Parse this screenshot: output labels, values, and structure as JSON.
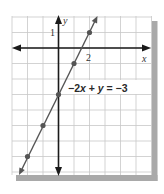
{
  "chart_data": {
    "type": "line",
    "title": "",
    "equation": "−2x + y = −3",
    "equation_parts": [
      "−2",
      "x",
      " + ",
      "y",
      " = −3"
    ],
    "xlabel": "x",
    "ylabel": "y",
    "x_tick_label": "2",
    "y_tick_label": "1",
    "xlim": [
      -3,
      6
    ],
    "ylim": [
      -8,
      2
    ],
    "grid": true,
    "slope": 2,
    "intercept": -3,
    "series": [
      {
        "name": "−2x + y = −3",
        "points": [
          {
            "x": -2,
            "y": -7
          },
          {
            "x": -1,
            "y": -5
          },
          {
            "x": 0,
            "y": -3
          },
          {
            "x": 1,
            "y": -1
          },
          {
            "x": 2,
            "y": 1
          }
        ]
      }
    ],
    "colors": {
      "grid": "#c8c8c8",
      "axis": "#1a1a1a",
      "line": "#555555",
      "point": "#555555",
      "shadow": "#a9a9a9"
    }
  }
}
